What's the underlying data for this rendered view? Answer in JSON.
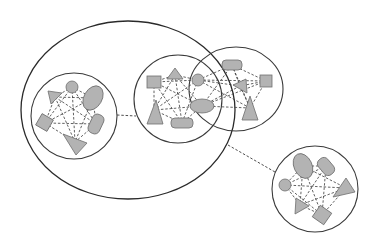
{
  "diagram": {
    "type": "nested-cluster-network",
    "colors": {
      "background": "#ffffff",
      "node_fill": "#b3b3b3",
      "node_stroke": "#6f6f6f",
      "boundary_stroke": "#2a2a2a",
      "edge_stroke": "#3a3a3a"
    },
    "big_group": {
      "shape": "ellipse",
      "cx": 128,
      "cy": 110,
      "rx": 107,
      "ry": 90,
      "contains": [
        "cluster_a",
        "cluster_b"
      ]
    },
    "clusters": [
      {
        "id": "cluster_a",
        "cx": 74,
        "cy": 116,
        "r": 43,
        "nodes": [
          {
            "shape": "circle",
            "x": 72,
            "y": 87
          },
          {
            "shape": "triangle",
            "x": 55,
            "y": 97
          },
          {
            "shape": "ellipse",
            "x": 93,
            "y": 98
          },
          {
            "shape": "square",
            "x": 45,
            "y": 123
          },
          {
            "shape": "rounded-rect",
            "x": 96,
            "y": 124
          },
          {
            "shape": "triangle",
            "x": 75,
            "y": 142
          }
        ]
      },
      {
        "id": "cluster_b",
        "cx": 178,
        "cy": 99,
        "r": 44,
        "nodes": [
          {
            "shape": "square",
            "x": 154,
            "y": 82
          },
          {
            "shape": "triangle",
            "x": 175,
            "y": 75
          },
          {
            "shape": "circle",
            "x": 198,
            "y": 80
          },
          {
            "shape": "ellipse",
            "x": 202,
            "y": 106
          },
          {
            "shape": "triangle",
            "x": 154,
            "y": 110
          },
          {
            "shape": "rounded-rect",
            "x": 182,
            "y": 123
          }
        ]
      },
      {
        "id": "cluster_c",
        "cx": 236,
        "cy": 89,
        "r": 47,
        "nodes": [
          {
            "shape": "rounded-rect",
            "x": 232,
            "y": 65
          },
          {
            "shape": "square",
            "x": 266,
            "y": 81
          },
          {
            "shape": "triangle",
            "x": 240,
            "y": 86
          },
          {
            "shape": "triangle",
            "x": 250,
            "y": 108
          }
        ]
      },
      {
        "id": "cluster_d",
        "cx": 315,
        "cy": 189,
        "r": 43,
        "nodes": [
          {
            "shape": "ellipse",
            "x": 303,
            "y": 166
          },
          {
            "shape": "rounded-rect",
            "x": 326,
            "y": 166
          },
          {
            "shape": "circle",
            "x": 285,
            "y": 185
          },
          {
            "shape": "triangle",
            "x": 346,
            "y": 188
          },
          {
            "shape": "triangle",
            "x": 300,
            "y": 205
          },
          {
            "shape": "square",
            "x": 322,
            "y": 215
          }
        ]
      }
    ],
    "inter_links": [
      {
        "from": "cluster_a",
        "to": "cluster_b",
        "style": "dashed"
      },
      {
        "from": "big_group",
        "to": "cluster_d",
        "style": "dashed"
      }
    ],
    "labels": []
  }
}
